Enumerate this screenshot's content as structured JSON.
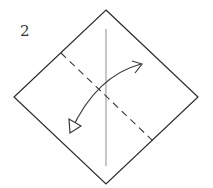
{
  "diagram": {
    "step_number": "2",
    "colors": {
      "outline": "#2a2a2a",
      "crease": "#9a9a9a",
      "fold_line": "#3a3a3a",
      "arrow": "#3a3a3a"
    },
    "elements": [
      {
        "type": "square-diamond",
        "description": "paper square rotated 45 degrees"
      },
      {
        "type": "crease-line",
        "orientation": "vertical",
        "description": "existing center crease"
      },
      {
        "type": "valley-fold-line",
        "style": "dashed",
        "description": "diagonal fold line from upper-left edge to lower-right edge"
      },
      {
        "type": "fold-unfold-arrow",
        "description": "curved double-ended arrow: fold and unfold"
      }
    ]
  }
}
